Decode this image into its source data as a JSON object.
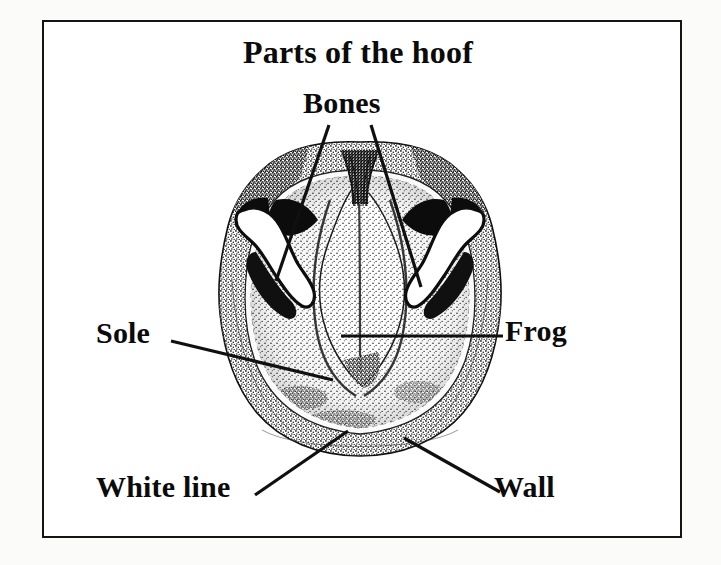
{
  "figure": {
    "title": "Parts of the hoof",
    "kind": "anatomical-line-drawing",
    "style": "black-and-white stippled engraving inside a thin rectangular border",
    "background_color": "#ffffff",
    "ink_color": "#101010",
    "border_color": "#141414"
  },
  "labels": {
    "title": "Parts of the hoof",
    "bones": "Bones",
    "sole": "Sole",
    "frog": "Frog",
    "white_line": "White line",
    "wall": "Wall"
  },
  "callouts": [
    {
      "name": "bones-left",
      "label": "Bones",
      "from": [
        329,
        125
      ],
      "to": [
        276,
        281
      ]
    },
    {
      "name": "bones-right",
      "label": "Bones",
      "from": [
        371,
        125
      ],
      "to": [
        421,
        287
      ]
    },
    {
      "name": "sole",
      "label": "Sole",
      "from": [
        171,
        341
      ],
      "to": [
        333,
        380
      ]
    },
    {
      "name": "frog",
      "label": "Frog",
      "from": [
        503,
        336
      ],
      "to": [
        341,
        336
      ]
    },
    {
      "name": "white-line",
      "label": "White line",
      "from": [
        255,
        495
      ],
      "to": [
        348,
        431
      ]
    },
    {
      "name": "wall",
      "label": "Wall",
      "from": [
        500,
        492
      ],
      "to": [
        404,
        438
      ]
    }
  ],
  "anatomy_parts": [
    "Bones",
    "Sole",
    "Frog",
    "White line",
    "Wall"
  ]
}
